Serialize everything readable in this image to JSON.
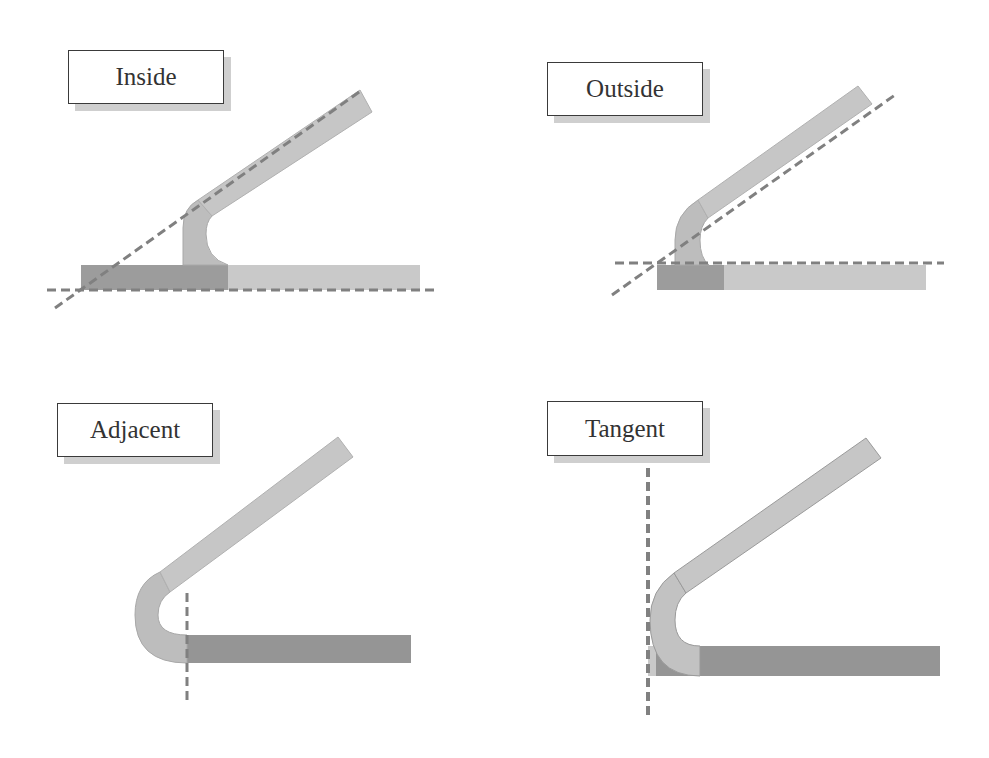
{
  "figure": {
    "colors": {
      "background": "#ffffff",
      "light_flange": "#c8c8c8",
      "dark_flange": "#8f8f8f",
      "bend": "#bdbdbd",
      "outline": "#9a9a9a",
      "dashed_line": "#808080",
      "label_border": "#3a3a3a",
      "label_shadow": "#cfcfcf"
    },
    "panels": [
      {
        "id": "inside",
        "label": "Inside",
        "label_box": {
          "x": 68,
          "y": 50,
          "w": 156,
          "h": 54
        }
      },
      {
        "id": "outside",
        "label": "Outside",
        "label_box": {
          "x": 547,
          "y": 62,
          "w": 156,
          "h": 54
        }
      },
      {
        "id": "adjacent",
        "label": "Adjacent",
        "label_box": {
          "x": 57,
          "y": 403,
          "w": 156,
          "h": 54
        }
      },
      {
        "id": "tangent",
        "label": "Tangent",
        "label_box": {
          "x": 547,
          "y": 401,
          "w": 156,
          "h": 55
        }
      }
    ]
  }
}
